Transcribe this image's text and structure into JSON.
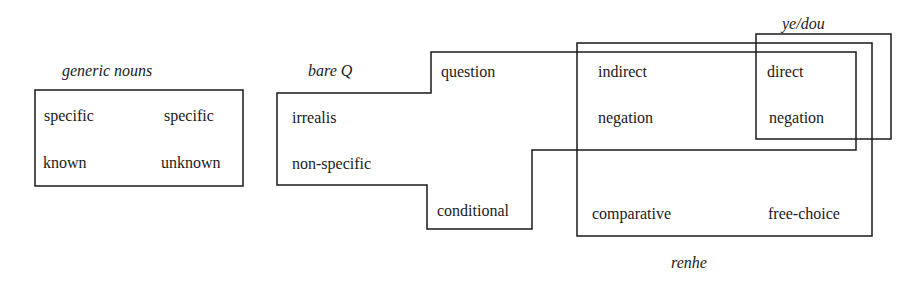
{
  "diagram": {
    "type": "semantic-map",
    "line_color": "#1a1a1a",
    "regions": {
      "generic_nouns": {
        "label": "generic nouns",
        "items": [
          "specific known",
          "specific unknown"
        ]
      },
      "bare_q": {
        "label": "bare Q",
        "items": [
          "question",
          "irrealis",
          "non-specific",
          "conditional",
          "indirect negation",
          "direct negation"
        ]
      },
      "renhe": {
        "label": "renhe",
        "items": [
          "indirect negation",
          "direct negation",
          "comparative",
          "free-choice"
        ]
      },
      "ye_dou": {
        "label": "ye/dou",
        "items": [
          "direct negation"
        ]
      }
    },
    "nodes": {
      "specific_1": "specific",
      "specific_2": "specific",
      "known": "known",
      "unknown": "unknown",
      "question": "question",
      "irrealis": "irrealis",
      "non_specific": "non-specific",
      "conditional": "conditional",
      "indirect": "indirect",
      "negation_1": "negation",
      "direct": "direct",
      "negation_2": "negation",
      "comparative": "comparative",
      "free_choice": "free-choice"
    }
  }
}
